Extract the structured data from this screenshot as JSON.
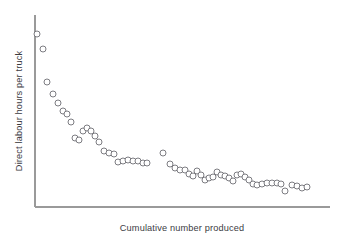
{
  "figure": {
    "background_color": "#ffffff",
    "axis_color": "#9a9a9a",
    "marker_stroke_color": "#6e6e74",
    "marker_fill_color": "#ffffff",
    "label_color": "#3b3b3f"
  },
  "chart_data": {
    "type": "scatter",
    "title": "",
    "subtitle": "",
    "xlabel": "Cumulative number produced",
    "ylabel": "Direct labour hours per truck",
    "grid": false,
    "legend": null,
    "legend_position": "none",
    "xlim": [
      0,
      100
    ],
    "ylim": [
      0,
      100
    ],
    "xticks": [],
    "yticks": [],
    "xticklabels": [],
    "yticklabels": [],
    "annotations": [],
    "marker": "open-circle",
    "marker_radius_px": 3.0,
    "n_points": 60,
    "series": [
      {
        "name": "Production block 1",
        "x": [
          0.8,
          3.9,
          9.2,
          12.0,
          14.8,
          17.5,
          19.2,
          23.0,
          24.8,
          27.0,
          28.6,
          31.2,
          33.5,
          35.8,
          38.6,
          41.0,
          44.0,
          46.3,
          49.0,
          51.5,
          53.8,
          56.2,
          58.6,
          61.0,
          63.4,
          65.8,
          68.2,
          70.6,
          73.0,
          75.4,
          78.0,
          80.5,
          83.0,
          85.5,
          88.0,
          90.5,
          93.0,
          95.4,
          97.8,
          100.0,
          102.5,
          105.0,
          107.4,
          109.8,
          112.3,
          114.8,
          117.2
        ],
        "y_label_note": "values are unitless positions read off the plot; axis is unscaled"
      }
    ],
    "points": [
      {
        "x": 37,
        "y": 34
      },
      {
        "x": 43,
        "y": 49
      },
      {
        "x": 47,
        "y": 82
      },
      {
        "x": 53,
        "y": 94
      },
      {
        "x": 58,
        "y": 103
      },
      {
        "x": 63,
        "y": 111
      },
      {
        "x": 67,
        "y": 114
      },
      {
        "x": 71,
        "y": 122
      },
      {
        "x": 75,
        "y": 138
      },
      {
        "x": 79,
        "y": 140
      },
      {
        "x": 83,
        "y": 131
      },
      {
        "x": 87,
        "y": 128
      },
      {
        "x": 91,
        "y": 131
      },
      {
        "x": 95,
        "y": 136
      },
      {
        "x": 99,
        "y": 142
      },
      {
        "x": 104,
        "y": 151
      },
      {
        "x": 109,
        "y": 153
      },
      {
        "x": 114,
        "y": 154
      },
      {
        "x": 118,
        "y": 162
      },
      {
        "x": 123,
        "y": 161
      },
      {
        "x": 128,
        "y": 160
      },
      {
        "x": 133,
        "y": 161
      },
      {
        "x": 138,
        "y": 161
      },
      {
        "x": 143,
        "y": 163
      },
      {
        "x": 147,
        "y": 163
      },
      {
        "x": 163,
        "y": 153
      },
      {
        "x": 170,
        "y": 164
      },
      {
        "x": 175,
        "y": 168
      },
      {
        "x": 180,
        "y": 170
      },
      {
        "x": 185,
        "y": 170
      },
      {
        "x": 189,
        "y": 174
      },
      {
        "x": 193,
        "y": 176
      },
      {
        "x": 197,
        "y": 171
      },
      {
        "x": 201,
        "y": 175
      },
      {
        "x": 205,
        "y": 180
      },
      {
        "x": 209,
        "y": 178
      },
      {
        "x": 213,
        "y": 177
      },
      {
        "x": 217,
        "y": 172
      },
      {
        "x": 221,
        "y": 175
      },
      {
        "x": 225,
        "y": 176
      },
      {
        "x": 229,
        "y": 178
      },
      {
        "x": 233,
        "y": 181
      },
      {
        "x": 237,
        "y": 175
      },
      {
        "x": 241,
        "y": 174
      },
      {
        "x": 245,
        "y": 177
      },
      {
        "x": 249,
        "y": 180
      },
      {
        "x": 253,
        "y": 184
      },
      {
        "x": 257,
        "y": 185
      },
      {
        "x": 262,
        "y": 184
      },
      {
        "x": 267,
        "y": 183
      },
      {
        "x": 272,
        "y": 183
      },
      {
        "x": 277,
        "y": 183
      },
      {
        "x": 281,
        "y": 184
      },
      {
        "x": 285,
        "y": 191
      },
      {
        "x": 292,
        "y": 185
      },
      {
        "x": 297,
        "y": 186
      },
      {
        "x": 302,
        "y": 188
      },
      {
        "x": 307,
        "y": 187
      }
    ],
    "gap": {
      "present": true,
      "between_x": [
        147,
        163
      ],
      "note": "break between two production blocks"
    }
  },
  "axes": {
    "y_axis": {
      "x": 35,
      "y_top": 15,
      "y_bottom": 207
    },
    "x_axis": {
      "y": 207,
      "x_left": 35,
      "x_right": 330
    }
  }
}
